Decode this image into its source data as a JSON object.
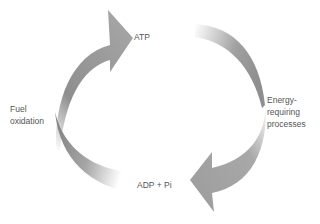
{
  "diagram": {
    "type": "cycle",
    "nodes": {
      "top": "ATP",
      "bottom": "ADP + Pi",
      "left": [
        "Fuel",
        "oxidation"
      ],
      "right": [
        "Energy-",
        "requiring",
        "processes"
      ]
    },
    "colors": {
      "arrow": "#9a9a9a",
      "arrow_dark": "#8a8a8a",
      "label": "#555555",
      "background": "#ffffff"
    }
  }
}
